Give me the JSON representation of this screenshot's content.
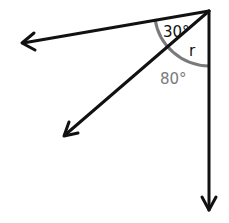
{
  "diagram": {
    "labels": {
      "angle_top": "30°",
      "angle_unknown": "r",
      "angle_total": "80°"
    },
    "colors": {
      "ray": "#111111",
      "arc": "#7a7a7a",
      "label_dark": "#111111",
      "label_gray": "#7a7a7a"
    }
  }
}
